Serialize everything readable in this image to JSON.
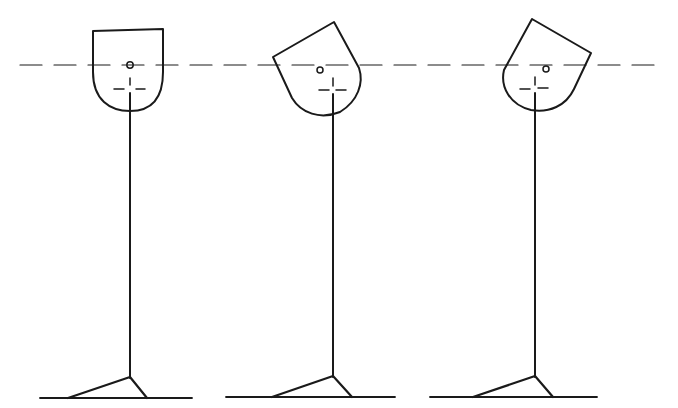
{
  "diagram": {
    "description": "Three stick figures showing head posture relative to a horizontal reference line",
    "reference_line": {
      "style": "dashed",
      "y": 65,
      "color": "#1a1a1a"
    },
    "figures": [
      {
        "id": "figure-1",
        "head_tilt": "neutral",
        "stem_x": 130
      },
      {
        "id": "figure-2",
        "head_tilt": "tilted-left",
        "stem_x": 333
      },
      {
        "id": "figure-3",
        "head_tilt": "tilted-right",
        "stem_x": 535
      }
    ],
    "line_color": "#1a1a1a",
    "background": "#ffffff"
  }
}
